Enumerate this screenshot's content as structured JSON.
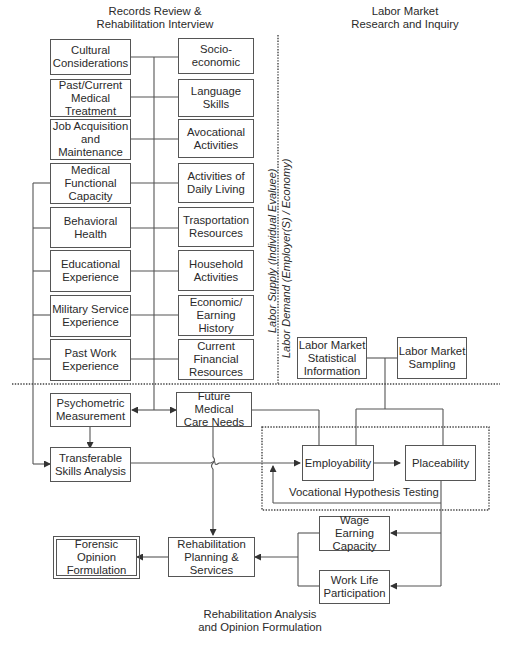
{
  "headings": {
    "records": "Records Review &\nRehabilitation Interview",
    "labor_market": "Labor Market\nResearch and Inquiry",
    "analysis": "Rehabilitation Analysis\nand Opinion Formulation"
  },
  "vertical_labels": {
    "supply": "Labor Supply (Individual Evaluee)",
    "demand": "Labor Demand (Employer(S) / Economy)"
  },
  "records_left": [
    "Cultural\nConsiderations",
    "Past/Current\nMedical\nTreatment",
    "Job Acquisition\nand\nMaintenance",
    "Medical\nFunctional\nCapacity",
    "Behavioral\nHealth",
    "Educational\nExperience",
    "Military Service\nExperience",
    "Past Work\nExperience"
  ],
  "records_right": [
    "Socio-\neconomic",
    "Language\nSkills",
    "Avocational\nActivities",
    "Activities of\nDaily Living",
    "Trasportation\nResources",
    "Household\nActivities",
    "Economic/\nEarning History",
    "Current\nFinancial\nResources"
  ],
  "labor_boxes": {
    "statistical": "Labor Market\nStatistical\nInformation",
    "sampling": "Labor Market\nSampling"
  },
  "analysis_boxes": {
    "psychometric": "Psychometric\nMeasurement",
    "future_medical": "Future Medical\nCare Needs",
    "transferable": "Transferable\nSkills Analysis",
    "employability": "Employability",
    "placeability": "Placeability",
    "vocational_testing": "Vocational Hypothesis Testing",
    "wage": "Wage Earning\nCapacity",
    "work_life": "Work Life\nParticipation",
    "rehab_planning": "Rehabilitation\nPlanning &\nServices",
    "forensic": "Forensic\nOpinion\nFormulation"
  },
  "colors": {
    "line": "#555555",
    "text": "#2a2a2a",
    "background": "#ffffff"
  }
}
